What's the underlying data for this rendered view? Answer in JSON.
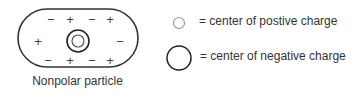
{
  "particle": {
    "caption": "Nonpolar particle",
    "top_row": [
      "−",
      "+",
      "−",
      "+"
    ],
    "middle_row": [
      "+",
      "−"
    ],
    "bottom_row": [
      "−",
      "+",
      "−",
      "+"
    ]
  },
  "legend": {
    "items": [
      {
        "symbol": "small-gray-circle",
        "text": "= center of postive charge"
      },
      {
        "symbol": "large-black-circle",
        "text": "= center of negative charge"
      }
    ]
  },
  "colors": {
    "positive_center": "#9a9a9a",
    "negative_center": "#222222",
    "outline": "#333333"
  }
}
